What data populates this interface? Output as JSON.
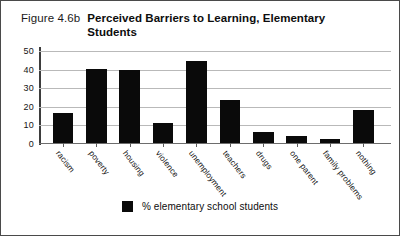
{
  "figure": {
    "number_label": "Figure 4.6b",
    "title": "Perceived Barriers to Learning, Elementary Students"
  },
  "legend": {
    "series_label": "% elementary school students",
    "swatch_color": "#0a0a0a",
    "position": "bottom-center"
  },
  "chart_data": {
    "type": "bar",
    "title": "Perceived Barriers to Learning, Elementary Students",
    "xlabel": "",
    "ylabel": "",
    "ylim": [
      0,
      50
    ],
    "yticks": [
      0,
      10,
      20,
      30,
      40,
      50
    ],
    "ytick_labels": [
      "0",
      "10",
      "20",
      "30",
      "40",
      "50"
    ],
    "grid": true,
    "grid_axis": "y",
    "bar_color": "#0a0a0a",
    "categories": [
      "racism",
      "poverty",
      "housing",
      "violence",
      "unemployment",
      "teachers",
      "drugs",
      "one parent",
      "family problems",
      "nothing"
    ],
    "series": [
      {
        "name": "% elementary school students",
        "values": [
          16,
          40,
          39,
          11,
          44,
          23,
          6,
          4,
          2,
          18
        ]
      }
    ]
  }
}
